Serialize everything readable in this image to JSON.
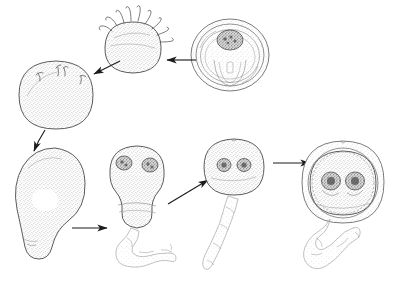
{
  "figure": {
    "caption": "",
    "background_color": "#ffffff",
    "ink_color": "#4a4a4a",
    "arrow_color": "#1c1c1c",
    "style": "pencil line drawing with stipple shading",
    "label_count": 0
  },
  "diagram_data": {
    "type": "cycle",
    "stage_count": 7,
    "arrow_count": 6,
    "stages": [
      {
        "id": "stage-1",
        "name": "encysted-cell",
        "label": "",
        "position": {
          "x": 230,
          "y": 55
        },
        "size": {
          "w": 78,
          "h": 72
        },
        "shape": "round cyst with outer wall and inner body",
        "nuclei": 1,
        "flagella": 0,
        "row": "top",
        "order": 1
      },
      {
        "id": "stage-2",
        "name": "flagellated-round-cell",
        "label": "",
        "position": {
          "x": 133,
          "y": 48
        },
        "size": {
          "w": 56,
          "h": 52
        },
        "shape": "round cell with emerging flagella at top",
        "nuclei": 0,
        "flagella": 9,
        "row": "top",
        "order": 2
      },
      {
        "id": "stage-3",
        "name": "smooth-round-cell",
        "label": "",
        "position": {
          "x": 56,
          "y": 95
        },
        "size": {
          "w": 73,
          "h": 68
        },
        "shape": "round stippled cell with short flagellar stubs",
        "nuclei": 0,
        "flagella": 4,
        "row": "top",
        "order": 3
      },
      {
        "id": "stage-4",
        "name": "pear-shaped-cell",
        "label": "",
        "position": {
          "x": 49,
          "y": 198
        },
        "size": {
          "w": 70,
          "h": 108
        },
        "shape": "pear/teardrop shaped cell with central vacuole",
        "nuclei": 0,
        "flagella": 0,
        "row": "bottom",
        "order": 4
      },
      {
        "id": "stage-5",
        "name": "binucleate-elongate-cell",
        "label": "",
        "position": {
          "x": 137,
          "y": 190
        },
        "size": {
          "w": 56,
          "h": 96
        },
        "shape": "elongate constricted cell with two nuclei and trailing tail",
        "nuclei": 2,
        "flagella": 0,
        "row": "bottom",
        "order": 5
      },
      {
        "id": "stage-6",
        "name": "binucleate-round-cell",
        "label": "",
        "position": {
          "x": 234,
          "y": 167
        },
        "size": {
          "w": 58,
          "h": 56
        },
        "shape": "round cell with two nuclei and long trailing tail",
        "nuclei": 2,
        "flagella": 0,
        "row": "bottom",
        "order": 6
      },
      {
        "id": "stage-7",
        "name": "binucleate-cyst",
        "label": "",
        "position": {
          "x": 343,
          "y": 182
        },
        "size": {
          "w": 82,
          "h": 82
        },
        "shape": "round cyst wall enclosing binucleate cell with trailing tail",
        "nuclei": 2,
        "flagella": 0,
        "row": "bottom",
        "order": 7
      }
    ],
    "arrows": [
      {
        "id": "arrow-1",
        "name": "arrow-stage1-to-stage2",
        "from": "stage-1",
        "to": "stage-2",
        "direction": "left",
        "x1": 196,
        "y1": 60,
        "x2": 166,
        "y2": 60
      },
      {
        "id": "arrow-2",
        "name": "arrow-stage2-to-stage3",
        "from": "stage-2",
        "to": "stage-3",
        "direction": "down-left",
        "x1": 120,
        "y1": 62,
        "x2": 92,
        "y2": 75
      },
      {
        "id": "arrow-3",
        "name": "arrow-stage3-to-stage4",
        "from": "stage-3",
        "to": "stage-4",
        "direction": "down",
        "x1": 44,
        "y1": 125,
        "x2": 33,
        "y2": 152
      },
      {
        "id": "arrow-4",
        "name": "arrow-stage4-to-stage5",
        "from": "stage-4",
        "to": "stage-5",
        "direction": "right",
        "x1": 72,
        "y1": 228,
        "x2": 106,
        "y2": 228
      },
      {
        "id": "arrow-5",
        "name": "arrow-stage5-to-stage6",
        "from": "stage-5",
        "to": "stage-6",
        "direction": "up-right",
        "x1": 168,
        "y1": 203,
        "x2": 207,
        "y2": 180
      },
      {
        "id": "arrow-6",
        "name": "arrow-stage6-to-stage7",
        "from": "stage-6",
        "to": "stage-7",
        "direction": "right",
        "x1": 273,
        "y1": 163,
        "x2": 309,
        "y2": 163
      }
    ]
  }
}
